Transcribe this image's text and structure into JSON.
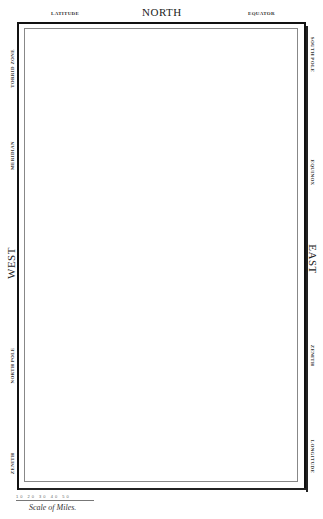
{
  "top": {
    "left_label": "LATITUDE",
    "center_label": "NORTH",
    "right_label": "EQUATOR"
  },
  "left_side": {
    "labels": [
      "TORRID ZONE",
      "MERIDIAN",
      "WEST",
      "NORTH POLE",
      "ZENITH"
    ]
  },
  "right_side": {
    "labels": [
      "SOUTH POLE",
      "EQUINOX",
      "EAST",
      "ZENITH",
      "LONGITUDE"
    ]
  },
  "scale": {
    "ticks": "10 20 30 40 50",
    "caption": "Scale of Miles."
  },
  "colors": {
    "frame": "#111111",
    "inner_line": "#888888",
    "background": "#ffffff"
  }
}
